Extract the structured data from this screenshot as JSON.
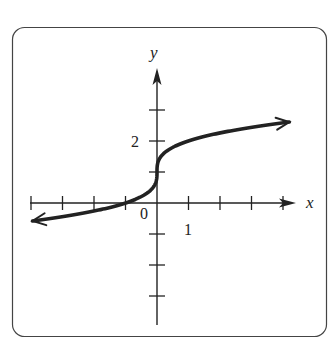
{
  "chart_data": {
    "type": "line",
    "title": "",
    "function": "y = cbrt(x) + 1",
    "xlabel": "x",
    "ylabel": "y",
    "xlim": [
      -4,
      4
    ],
    "ylim": [
      -3,
      3
    ],
    "x_ticks": [
      -4,
      -3,
      -2,
      -1,
      1,
      2,
      3,
      4
    ],
    "y_ticks": [
      -3,
      -2,
      -1,
      1,
      2,
      3
    ],
    "tick_labels": {
      "origin": "0",
      "x": "1",
      "y": "2"
    },
    "grid": false,
    "series": [
      {
        "name": "y = cbrt(x) + 1",
        "x": [
          -4,
          -3,
          -2,
          -1,
          -0.5,
          -0.125,
          0,
          0.125,
          0.5,
          1,
          2,
          3,
          4
        ],
        "values": [
          -0.587,
          -0.442,
          -0.26,
          0,
          0.206,
          0.5,
          1,
          1.5,
          1.794,
          2,
          2.26,
          2.442,
          2.587
        ]
      }
    ],
    "arrows_on_curve_ends": true
  },
  "colors": {
    "ink": "#222222",
    "frame": "#444444",
    "background": "#ffffff"
  }
}
